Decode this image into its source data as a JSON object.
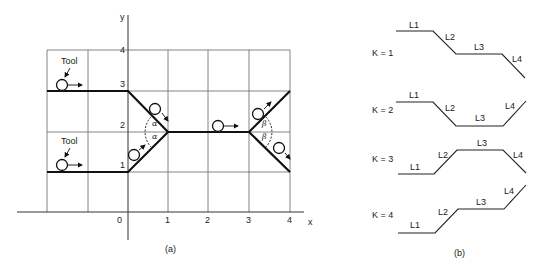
{
  "figure_a": {
    "caption": "(a)",
    "axes": {
      "x_label": "x",
      "y_label": "y",
      "x_ticks": [
        "0",
        "1",
        "2",
        "3",
        "4"
      ],
      "y_ticks": [
        "1",
        "2",
        "3",
        "4"
      ]
    },
    "tool_label_upper": "Tool",
    "tool_label_lower": "Tool",
    "angle_alpha_1": "α",
    "angle_alpha_2": "α",
    "angle_beta_1": "β",
    "angle_beta_2": "β",
    "path_upper": [
      [
        -2,
        2.9
      ],
      [
        0,
        2.9
      ],
      [
        1,
        2
      ],
      [
        3,
        2
      ],
      [
        4,
        2.9
      ]
    ],
    "path_lower": [
      [
        -2,
        1
      ],
      [
        0,
        1
      ],
      [
        1,
        2
      ],
      [
        3,
        2
      ],
      [
        4,
        1
      ]
    ]
  },
  "figure_b": {
    "caption": "(b)",
    "cases": [
      {
        "label": "K = 1",
        "segments": [
          "L1",
          "L2",
          "L3",
          "L4"
        ]
      },
      {
        "label": "K = 2",
        "segments": [
          "L1",
          "L2",
          "L3",
          "L4"
        ]
      },
      {
        "label": "K = 3",
        "segments": [
          "L1",
          "L2",
          "L3",
          "L4"
        ]
      },
      {
        "label": "K = 4",
        "segments": [
          "L1",
          "L2",
          "L3",
          "L4"
        ]
      }
    ]
  },
  "colors": {
    "line": "#1a1a1a",
    "grid": "#555555",
    "background": "#ffffff"
  }
}
